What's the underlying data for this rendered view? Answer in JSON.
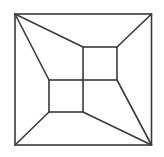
{
  "diagram": {
    "stroke_color": "#3a3a3a",
    "background_color": "#ffffff",
    "shapes": [
      {
        "id": "outer-square",
        "type": "square"
      },
      {
        "id": "inner-square-upper-right",
        "type": "square"
      },
      {
        "id": "inner-square-lower-left",
        "type": "square"
      }
    ],
    "connectors": [
      {
        "id": "top-left-to-upper-square",
        "from": "outer-top-left",
        "to": "upper-square-top-left"
      },
      {
        "id": "top-left-to-lower-square",
        "from": "outer-top-left",
        "to": "lower-square-top-left"
      },
      {
        "id": "top-right-to-upper-square",
        "from": "outer-top-right",
        "to": "upper-square-top-right"
      },
      {
        "id": "bottom-left-to-lower-square",
        "from": "outer-bottom-left",
        "to": "lower-square-bottom-left"
      },
      {
        "id": "bottom-right-to-lower-square",
        "from": "outer-bottom-right",
        "to": "lower-square-bottom-right"
      },
      {
        "id": "bottom-right-to-upper-square",
        "from": "outer-bottom-right",
        "to": "upper-square-bottom-right"
      }
    ]
  }
}
